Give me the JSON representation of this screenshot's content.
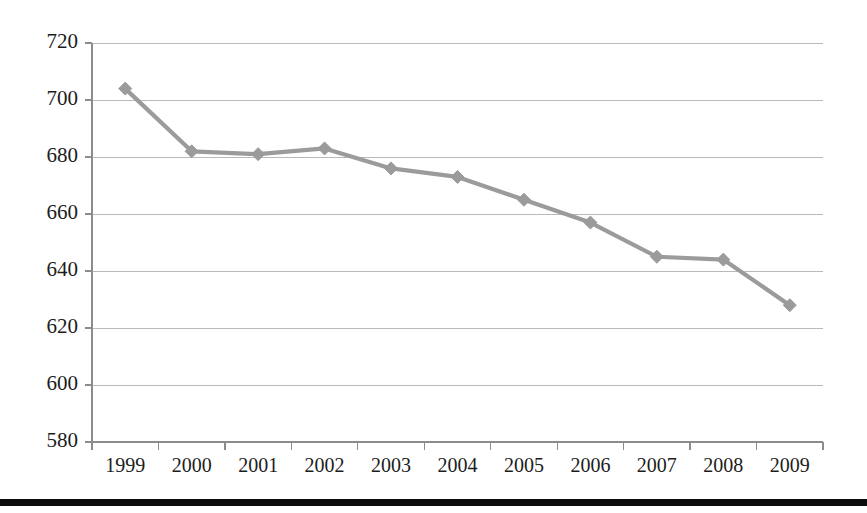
{
  "chart_data": {
    "type": "line",
    "title": "",
    "subtitle": "",
    "xlabel": "",
    "ylabel": "",
    "categories": [
      "1999",
      "2000",
      "2001",
      "2002",
      "2003",
      "2004",
      "2005",
      "2006",
      "2007",
      "2008",
      "2009"
    ],
    "values": [
      704,
      682,
      681,
      683,
      676,
      673,
      665,
      657,
      645,
      644,
      628
    ],
    "series": [
      {
        "name": "Series 1",
        "values": [
          704,
          682,
          681,
          683,
          676,
          673,
          665,
          657,
          645,
          644,
          628
        ]
      }
    ],
    "ylim": [
      580,
      720
    ],
    "yticks": [
      580,
      600,
      620,
      640,
      660,
      680,
      700,
      720
    ],
    "ytick_labels": [
      "580",
      "600",
      "620",
      "640",
      "660",
      "680",
      "700",
      "720"
    ],
    "xtick_labels": [
      "1999",
      "2000",
      "2001",
      "2002",
      "2003",
      "2004",
      "2005",
      "2006",
      "2007",
      "2008",
      "2009"
    ],
    "grid": true,
    "grid_axis": "y",
    "legend": false,
    "legend_position": "none",
    "marker": "diamond",
    "annotations": [],
    "colors": {
      "series_line": "#9b9b9b",
      "series_marker": "#9b9b9b",
      "gridline": "#b9b9b9",
      "axis": "#8c8c8c",
      "tick_label": "#1c1c1c",
      "background": "#ffffff",
      "bottom_rule": "#0d0d0d"
    }
  },
  "layout": {
    "plot_left": 92,
    "plot_right": 823,
    "plot_top": 43,
    "plot_bottom": 442
  }
}
